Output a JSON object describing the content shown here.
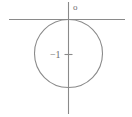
{
  "figure": {
    "kind": "geometry-diagram",
    "background_color": "#ffffff",
    "line_color": "#8a8a8a",
    "text_color": "#6f6f6f",
    "labels": {
      "origin": "o",
      "center": "−1"
    },
    "axes": {
      "x_axis": {
        "name": "horizontal-axis",
        "y": 19.5,
        "x_start": 9,
        "x_end": 125
      },
      "y_axis": {
        "name": "vertical-axis",
        "x": 68.5,
        "y_start": 2,
        "y_end": 114
      }
    },
    "circle": {
      "center_x": 68.5,
      "center_y": 53.5,
      "radius": 34,
      "tangent_point": "origin"
    },
    "tick": {
      "name": "center-tick",
      "x_start": 65,
      "x_end": 72,
      "y": 54.5
    }
  }
}
